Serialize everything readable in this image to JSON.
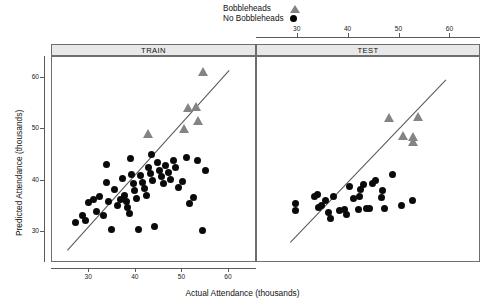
{
  "chart_data": {
    "type": "scatter",
    "title": "",
    "xlabel": "Actual Attendance (thousands)",
    "ylabel": "Predicted Attendance (thousands)",
    "xlim": [
      22,
      66
    ],
    "ylim": [
      24,
      64
    ],
    "xticks": [
      30,
      40,
      50,
      60
    ],
    "yticks": [
      30,
      40,
      50,
      60
    ],
    "grid": false,
    "legend_position": "top",
    "panels": [
      {
        "label": "TRAIN",
        "reference_line": {
          "from": [
            25.2,
            26.5
          ],
          "to": [
            60.0,
            61.5
          ],
          "style": "solid",
          "color": "#555555"
        },
        "series": [
          {
            "name": "No Bobbleheads",
            "marker": "circle",
            "color": "#0a0a0a",
            "points": [
              [
                27.0,
                31.8
              ],
              [
                28.5,
                33.3
              ],
              [
                29.2,
                32.2
              ],
              [
                30.8,
                36.3
              ],
              [
                31.5,
                34.0
              ],
              [
                32.3,
                37.0
              ],
              [
                33.0,
                33.2
              ],
              [
                33.6,
                39.7
              ],
              [
                34.2,
                36.0
              ],
              [
                34.8,
                30.6
              ],
              [
                35.4,
                38.2
              ],
              [
                36.0,
                35.2
              ],
              [
                36.6,
                36.4
              ],
              [
                37.2,
                40.5
              ],
              [
                37.6,
                37.1
              ],
              [
                37.9,
                36.0
              ],
              [
                38.2,
                34.8
              ],
              [
                38.6,
                33.6
              ],
              [
                39.0,
                41.2
              ],
              [
                39.4,
                39.4
              ],
              [
                39.8,
                38.0
              ],
              [
                40.1,
                36.6
              ],
              [
                40.5,
                30.5
              ],
              [
                41.0,
                41.0
              ],
              [
                41.4,
                39.6
              ],
              [
                41.8,
                38.4
              ],
              [
                42.2,
                37.2
              ],
              [
                42.8,
                42.5
              ],
              [
                43.2,
                41.3
              ],
              [
                43.6,
                40.0
              ],
              [
                44.0,
                31.0
              ],
              [
                44.6,
                43.5
              ],
              [
                45.0,
                42.0
              ],
              [
                45.4,
                40.7
              ],
              [
                45.9,
                39.5
              ],
              [
                46.4,
                43.0
              ],
              [
                46.9,
                41.6
              ],
              [
                47.4,
                40.2
              ],
              [
                48.0,
                44.0
              ],
              [
                48.6,
                42.6
              ],
              [
                49.2,
                38.6
              ],
              [
                50.0,
                39.8
              ],
              [
                50.8,
                44.5
              ],
              [
                51.6,
                35.6
              ],
              [
                52.4,
                36.8
              ],
              [
                53.2,
                44.0
              ],
              [
                54.2,
                30.4
              ],
              [
                55.0,
                42.0
              ],
              [
                33.8,
                43.2
              ],
              [
                38.8,
                44.3
              ],
              [
                43.4,
                45.0
              ],
              [
                29.8,
                35.8
              ]
            ]
          },
          {
            "name": "Bobbleheads",
            "marker": "triangle",
            "color": "#848484",
            "points": [
              [
                42.6,
                49.0
              ],
              [
                50.4,
                50.0
              ],
              [
                51.2,
                54.0
              ],
              [
                53.0,
                54.2
              ],
              [
                54.5,
                61.0
              ],
              [
                53.4,
                51.5
              ]
            ]
          }
        ]
      },
      {
        "label": "TEST",
        "reference_line": {
          "from": [
            28.5,
            28.0
          ],
          "to": [
            59.0,
            59.5
          ],
          "style": "solid",
          "color": "#555555"
        },
        "series": [
          {
            "name": "No Bobbleheads",
            "marker": "circle",
            "color": "#0a0a0a",
            "points": [
              [
                29.5,
                35.6
              ],
              [
                29.6,
                34.2
              ],
              [
                33.2,
                37.0
              ],
              [
                33.9,
                37.3
              ],
              [
                34.0,
                34.8
              ],
              [
                34.7,
                35.2
              ],
              [
                36.0,
                33.8
              ],
              [
                36.4,
                32.6
              ],
              [
                38.3,
                34.2
              ],
              [
                39.1,
                34.3
              ],
              [
                40.1,
                38.8
              ],
              [
                41.0,
                36.5
              ],
              [
                42.2,
                37.0
              ],
              [
                42.4,
                38.3
              ],
              [
                43.0,
                39.2
              ],
              [
                44.0,
                34.5
              ],
              [
                46.5,
                36.8
              ],
              [
                46.7,
                38.0
              ],
              [
                47.0,
                34.6
              ],
              [
                48.6,
                41.2
              ],
              [
                50.3,
                35.2
              ],
              [
                52.6,
                36.2
              ],
              [
                44.6,
                39.5
              ],
              [
                41.9,
                34.4
              ],
              [
                37.0,
                36.9
              ],
              [
                43.6,
                34.5
              ],
              [
                45.2,
                40.0
              ],
              [
                39.6,
                33.4
              ],
              [
                35.5,
                36.1
              ]
            ]
          },
          {
            "name": "Bobbleheads",
            "marker": "triangle",
            "color": "#848484",
            "points": [
              [
                48.0,
                52.0
              ],
              [
                53.6,
                52.2
              ],
              [
                50.8,
                48.6
              ],
              [
                52.6,
                48.4
              ],
              [
                52.6,
                47.4
              ]
            ]
          }
        ]
      }
    ]
  },
  "legend": {
    "entries": [
      {
        "label": "Bobbleheads",
        "symbol": "triangle-icon"
      },
      {
        "label": "No Bobbleheads",
        "symbol": "circle-icon"
      }
    ]
  },
  "axes": {
    "x_label": "Actual Attendance (thousands)",
    "y_label": "Predicted Attendance (thousands)",
    "x_tick_labels": [
      "30",
      "40",
      "50",
      "60"
    ],
    "y_tick_labels": [
      "30",
      "40",
      "50",
      "60"
    ]
  },
  "panels": {
    "left_label": "TRAIN",
    "right_label": "TEST"
  },
  "colors": {
    "bobblehead_marker": "#848484",
    "no_bobblehead_marker": "#0a0a0a",
    "reference_line": "#555555",
    "strip_background": "#e8e8e8",
    "frame": "#6e6e6e"
  }
}
